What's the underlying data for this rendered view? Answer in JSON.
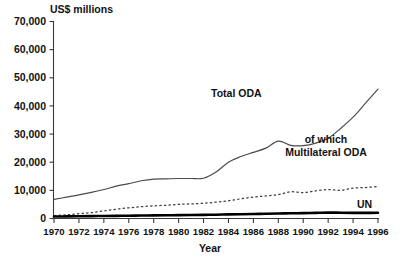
{
  "chart_data": {
    "type": "line",
    "title": "",
    "ylabel": "US$ millions",
    "xlabel": "Year",
    "ylim": [
      0,
      70000
    ],
    "xlim": [
      1970,
      1996
    ],
    "grid": false,
    "legend_position": "inline-annotations",
    "ytick_labels": [
      "0",
      "10,000",
      "20,000",
      "30,000",
      "40,000",
      "50,000",
      "60,000",
      "70,000"
    ],
    "ytick_values": [
      0,
      10000,
      20000,
      30000,
      40000,
      50000,
      60000,
      70000
    ],
    "xtick_labels": [
      "1970",
      "1972",
      "1974",
      "1976",
      "1978",
      "1980",
      "1982",
      "1984",
      "1986",
      "1988",
      "1990",
      "1992",
      "1994",
      "1996"
    ],
    "xtick_values": [
      1970,
      1972,
      1974,
      1976,
      1978,
      1980,
      1982,
      1984,
      1986,
      1988,
      1990,
      1992,
      1994,
      1996
    ],
    "x": [
      1970,
      1971,
      1972,
      1973,
      1974,
      1975,
      1976,
      1977,
      1978,
      1979,
      1980,
      1981,
      1982,
      1983,
      1984,
      1985,
      1986,
      1987,
      1988,
      1989,
      1990,
      1991,
      1992,
      1993,
      1994,
      1995,
      1996
    ],
    "series": [
      {
        "name": "Total ODA",
        "style": "solid-thin",
        "color": "#4a4a4a",
        "values": [
          6800,
          7600,
          8400,
          9300,
          10300,
          11500,
          12400,
          13400,
          14000,
          14100,
          14200,
          14200,
          14300,
          16500,
          20000,
          22000,
          23500,
          25000,
          27500,
          26000,
          25900,
          26800,
          28500,
          32000,
          36000,
          41000,
          46000
        ]
      },
      {
        "name": "of which Multilateral ODA",
        "style": "dashed",
        "color": "#3f3f3f",
        "values": [
          1000,
          1300,
          1700,
          2100,
          2700,
          3300,
          3800,
          4200,
          4500,
          4700,
          5000,
          5200,
          5400,
          5800,
          6300,
          7000,
          7600,
          8000,
          8500,
          9500,
          9200,
          9800,
          10300,
          10000,
          10800,
          11000,
          11400
        ]
      },
      {
        "name": "UN",
        "style": "solid-thick",
        "color": "#000000",
        "values": [
          700,
          750,
          800,
          850,
          900,
          950,
          1000,
          1050,
          1100,
          1150,
          1200,
          1250,
          1300,
          1350,
          1450,
          1500,
          1600,
          1700,
          1800,
          1850,
          1900,
          2000,
          2100,
          2050,
          2000,
          2000,
          2050
        ]
      }
    ],
    "annotations": [
      {
        "text": "Total ODA",
        "near_year": 1986,
        "near_value": 47000
      },
      {
        "text": "of which",
        "near_year": 1991,
        "near_value": 26500
      },
      {
        "text": "Multilateral ODA",
        "near_year": 1991,
        "near_value": 23500
      },
      {
        "text": "UN",
        "near_year": 1995,
        "near_value": 5200
      }
    ]
  },
  "labels": {
    "y_axis_title": "US$ millions",
    "x_axis_title": "Year",
    "total_oda": "Total ODA",
    "of_which": "of which",
    "multilateral_oda": "Multilateral ODA",
    "un": "UN"
  },
  "colors": {
    "background": "#ffffff",
    "axis": "#3a3a3a",
    "text": "#111111",
    "total_oda": "#4a4a4a",
    "multilateral_oda": "#3f3f3f",
    "un": "#000000"
  }
}
